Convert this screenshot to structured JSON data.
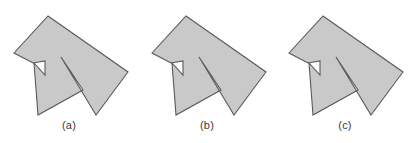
{
  "figure": {
    "name": "polygon-fill-rule-comparison",
    "background_color": "#ffffff",
    "fill_color": "#c9c9c9",
    "stroke_color": "#5a5a5a",
    "stroke_width": 1,
    "caption_color": "#3a3a3a"
  },
  "panels": [
    {
      "id": "a",
      "caption": "(a)",
      "fill_rule": "evenodd",
      "polygon_points": "48,16 128,72 96,115 38,115 14,53",
      "outline_path": "M48,16 L128,72 L96,115 L38,115 L14,53 Z",
      "shape_path": "M48,16 L128,72 L96,115 L61,57 L83,90 L38,115 L34,63 L45,75 L45,61 L33,63 L14,53 Z",
      "inner_notch_path": "M34,63 L45,75 L45,61 Z",
      "hole_path": "M61,57 L83,90 L45,75 L34,63 Z"
    },
    {
      "id": "b",
      "caption": "(b)",
      "fill_rule": "nonzero",
      "polygon_points": "186,16 266,72 234,115 176,115 152,53",
      "outline_path": "M186,16 L266,72 L234,115 L176,115 L152,53 Z",
      "shape_path": "M186,16 L266,72 L234,115 L199,57 L221,90 L176,115 L172,63 L183,75 L183,61 L171,63 L152,53 Z",
      "inner_notch_path": "M172,63 L183,75 L183,61 Z",
      "hole_path": ""
    },
    {
      "id": "c",
      "caption": "(c)",
      "fill_rule": "evenodd-variant",
      "polygon_points": "323,16 403,72 371,115 313,115 289,53",
      "outline_path": "M323,16 L403,72 L371,115 L313,115 L289,53 Z",
      "shape_path": "M323,16 L403,72 L371,115 L336,57 L358,90 L313,115 L309,63 L320,75 L320,61 L308,63 L289,53 Z",
      "inner_notch_path": "M309,63 L320,75 L320,61 Z",
      "hole_path": "M336,57 L358,90 L320,75 L309,63 Z"
    }
  ]
}
